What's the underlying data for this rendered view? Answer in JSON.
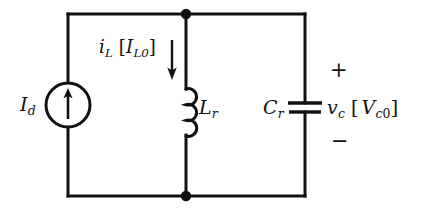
{
  "figure": {
    "kind": "electrical-circuit-schematic",
    "background_color": "#ffffff",
    "ink_color": "#111111",
    "line_width_px": 3
  },
  "labels": {
    "current_source": {
      "symbol": "I",
      "subscript": "d",
      "full_text": "I_d"
    },
    "inductor_current": {
      "symbol": "i",
      "subscript": "L",
      "bracket_open": "[",
      "bracket_symbol": "I",
      "bracket_subscript": "L0",
      "bracket_close": "]",
      "full_text": "i_L [I_L0]"
    },
    "inductor": {
      "symbol": "L",
      "subscript": "r",
      "full_text": "L_r"
    },
    "capacitor": {
      "symbol": "C",
      "subscript": "r",
      "full_text": "C_r"
    },
    "capacitor_voltage": {
      "symbol": "v",
      "subscript": "c",
      "bracket_open": "[",
      "bracket_symbol": "V",
      "bracket_subscript_italic": "c",
      "bracket_subscript_digit": "0",
      "bracket_close": "]",
      "full_text": "v_c [V_c0]"
    },
    "polarity_plus": "+",
    "polarity_minus": "−"
  },
  "components": [
    {
      "name": "current-source",
      "type": "dc-current-source",
      "label": "I_d",
      "arrow_direction": "up",
      "center_x": 68,
      "center_y": 105,
      "radius": 22
    },
    {
      "name": "inductor",
      "type": "inductor-coil",
      "label": "L_r",
      "x": 186,
      "y_top": 88,
      "y_bottom": 136,
      "turns": 3
    },
    {
      "name": "capacitor",
      "type": "capacitor-parallel-plate",
      "label": "C_r",
      "x": 305,
      "plate_top_y": 103,
      "plate_bottom_y": 112,
      "plate_half_width": 17
    },
    {
      "name": "inductor-current-arrow",
      "type": "annotation-arrow",
      "direction": "down",
      "x": 172,
      "y_start": 40,
      "y_end": 79
    }
  ],
  "nodes": [
    {
      "name": "top-node",
      "x": 186,
      "y": 14
    },
    {
      "name": "bottom-node",
      "x": 186,
      "y": 196
    }
  ],
  "wires": {
    "top_rail_y": 14,
    "bottom_rail_y": 196,
    "left_rail_x": 68,
    "middle_rail_x": 186,
    "right_rail_x": 305
  }
}
